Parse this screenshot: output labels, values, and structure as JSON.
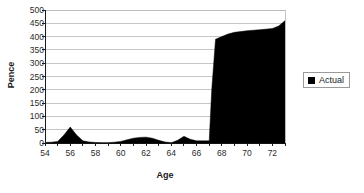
{
  "chart_data": {
    "type": "area",
    "title": "",
    "xlabel": "Age",
    "ylabel": "Pence",
    "xlim": [
      54,
      73
    ],
    "ylim": [
      0,
      500
    ],
    "grid": true,
    "legend_position": "right",
    "x_tick_labels": [
      "54",
      "56",
      "58",
      "60",
      "62",
      "64",
      "66",
      "68",
      "70",
      "72"
    ],
    "x_tick_values": [
      54,
      56,
      58,
      60,
      62,
      64,
      66,
      68,
      70,
      72
    ],
    "x_minor_ticks": [
      54,
      55,
      56,
      57,
      58,
      59,
      60,
      61,
      62,
      63,
      64,
      65,
      66,
      67,
      68,
      69,
      70,
      71,
      72,
      73
    ],
    "y_tick_labels": [
      "0",
      "50",
      "100",
      "150",
      "200",
      "250",
      "300",
      "350",
      "400",
      "450",
      "500"
    ],
    "y_tick_values": [
      0,
      50,
      100,
      150,
      200,
      250,
      300,
      350,
      400,
      450,
      500
    ],
    "series": [
      {
        "name": "Actual",
        "color": "#000000",
        "x": [
          54,
          54.5,
          55,
          55.5,
          56,
          56.5,
          57,
          57.5,
          58,
          58.5,
          59,
          59.5,
          60,
          60.5,
          61,
          61.5,
          62,
          62.5,
          63,
          63.5,
          64,
          64.5,
          65,
          65.5,
          66,
          66.5,
          67,
          67.2,
          67.5,
          68,
          68.5,
          69,
          70,
          71,
          72,
          72.5,
          73
        ],
        "values": [
          2,
          3,
          6,
          30,
          60,
          30,
          8,
          4,
          2,
          1,
          1,
          3,
          6,
          12,
          18,
          21,
          22,
          18,
          10,
          4,
          1,
          10,
          25,
          14,
          8,
          8,
          8,
          200,
          390,
          400,
          410,
          416,
          422,
          426,
          430,
          440,
          460
        ]
      }
    ]
  },
  "legend": {
    "items": [
      {
        "label": "Actual",
        "marker": "black-square"
      }
    ]
  },
  "axes": {
    "y_title": "Pence",
    "x_title": "Age"
  },
  "colors": {
    "series_fill": "#000000",
    "gridline": "#b8b8b8",
    "axis_line": "#1a1a1a",
    "plot_background": "#ffffff",
    "legend_border": "#9a9a9a"
  },
  "plot_geometry": {
    "left": 45,
    "right": 285,
    "top": 10,
    "bottom": 143
  }
}
